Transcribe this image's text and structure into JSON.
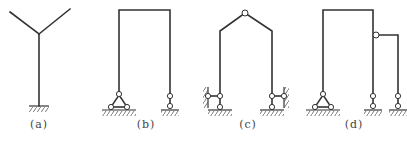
{
  "figure": {
    "panels": [
      {
        "id": "a",
        "caption": "(a)",
        "description": "Y-shaped cantilever with fixed base",
        "supports": [
          "fixed"
        ]
      },
      {
        "id": "b",
        "caption": "(b)",
        "description": "Portal frame with triangulated link support at left and single link support at right",
        "supports": [
          "two-link-triangle",
          "single-link"
        ]
      },
      {
        "id": "c",
        "caption": "(c)",
        "description": "Gable frame with top hinge, each column supported by horizontal and vertical links",
        "supports": [
          "h-v-links",
          "h-v-links"
        ],
        "hinges": [
          "ridge"
        ]
      },
      {
        "id": "d",
        "caption": "(d)",
        "description": "Portal frame with hinged side extension; triangulated link support at left, single links under right column and extension",
        "supports": [
          "two-link-triangle",
          "single-link",
          "single-link"
        ],
        "hinges": [
          "side-connection"
        ]
      }
    ],
    "colors": {
      "line": "#333333",
      "background": "#ffffff"
    }
  }
}
